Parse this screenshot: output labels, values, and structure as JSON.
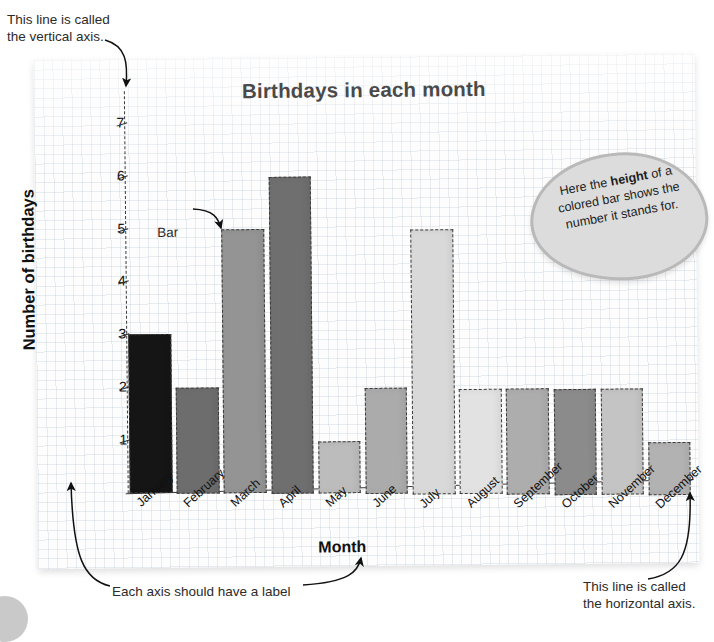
{
  "annotations": {
    "vertical_axis_note": "This line is called\nthe vertical axis.",
    "axis_label_note": "Each axis should have a label",
    "horizontal_axis_note": "This line is called\nthe horizontal axis.",
    "bar_callout": "Bar",
    "bubble_line1": "Here the ",
    "bubble_bold": "height",
    "bubble_line2": "of a colored bar shows the number it stands for."
  },
  "chart_data": {
    "type": "bar",
    "title": "Birthdays in each month",
    "xlabel": "Month",
    "ylabel": "Number of birthdays",
    "categories": [
      "January",
      "February",
      "March",
      "April",
      "May",
      "June",
      "July",
      "August",
      "September",
      "October",
      "November",
      "December"
    ],
    "values": [
      3,
      2,
      5,
      6,
      1,
      2,
      5,
      2,
      2,
      2,
      2,
      1
    ],
    "bar_colors": [
      "#151515",
      "#6d6d6d",
      "#949494",
      "#6f6f6f",
      "#bcbcbc",
      "#ababab",
      "#d9d9d9",
      "#e2e2e2",
      "#adadad",
      "#8b8b8b",
      "#c4c4c4",
      "#b2b2b2"
    ],
    "ylim": [
      0,
      7.6
    ],
    "yticks": [
      1,
      2,
      3,
      4,
      5,
      6,
      7
    ],
    "ytick_labels": [
      "1",
      "2",
      "3",
      "4",
      "5",
      "6",
      "7"
    ],
    "grid": true,
    "legend": false
  },
  "colors": {
    "title": "#4a4a4a",
    "axis": "#3a3a3a",
    "bubble_fill": "#dcdcdc",
    "bubble_border": "#b9b9b9",
    "panel_bg": "#fdfdfd"
  }
}
